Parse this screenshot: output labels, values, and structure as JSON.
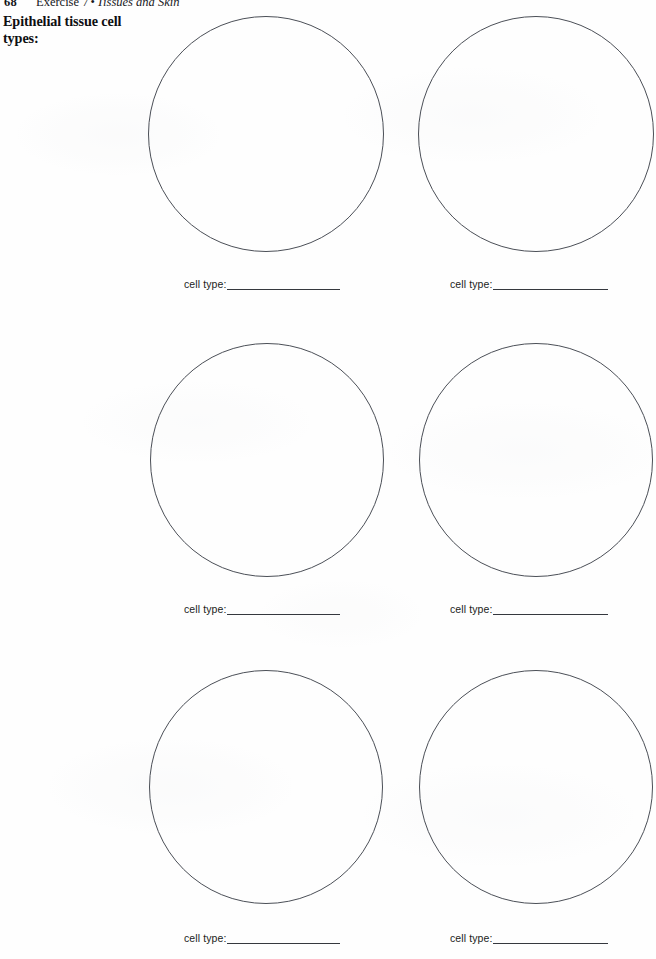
{
  "page": {
    "folio": "68",
    "running_head": {
      "exercise": "Exercise 7",
      "bullet": "•",
      "topic": "Tissues and Skin"
    },
    "margin_heading": "Epithelial tissue cell types:"
  },
  "labels": {
    "cell_type": "cell type:"
  },
  "cells": [
    {
      "id": "cell-1",
      "row": 1,
      "column": "left",
      "cell_type_label": "cell type:",
      "cell_type_value": ""
    },
    {
      "id": "cell-2",
      "row": 1,
      "column": "right",
      "cell_type_label": "cell type:",
      "cell_type_value": ""
    },
    {
      "id": "cell-3",
      "row": 2,
      "column": "left",
      "cell_type_label": "cell type:",
      "cell_type_value": ""
    },
    {
      "id": "cell-4",
      "row": 2,
      "column": "right",
      "cell_type_label": "cell type:",
      "cell_type_value": ""
    },
    {
      "id": "cell-5",
      "row": 3,
      "column": "left",
      "cell_type_label": "cell type:",
      "cell_type_value": ""
    },
    {
      "id": "cell-6",
      "row": 3,
      "column": "right",
      "cell_type_label": "cell type:",
      "cell_type_value": ""
    }
  ],
  "colors": {
    "paper": "#fefefe",
    "ink": "#15161a",
    "circle_stroke": "#4b4f57",
    "rule_stroke": "#35383e"
  }
}
